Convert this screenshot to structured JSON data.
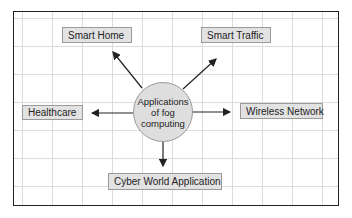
{
  "diagram": {
    "center": {
      "label_lines": [
        "Applications",
        "of fog",
        "computing"
      ]
    },
    "nodes": {
      "smart_home": "Smart Home",
      "smart_traffic": "Smart Traffic",
      "healthcare": "Healthcare",
      "wireless_network": "Wireless Network",
      "cyber_world": "Cyber World Application"
    },
    "edges": [
      {
        "from": "Applications of fog computing",
        "to": "Smart Home"
      },
      {
        "from": "Applications of fog computing",
        "to": "Smart Traffic"
      },
      {
        "from": "Applications of fog computing",
        "to": "Healthcare"
      },
      {
        "from": "Applications of fog computing",
        "to": "Wireless Network"
      },
      {
        "from": "Applications of fog computing",
        "to": "Cyber World Application"
      }
    ],
    "colors": {
      "node_fill": "#e2e2e2",
      "node_border": "#9a9a9a",
      "frame_border": "#222222",
      "grid": "#dcdcdc",
      "arrow": "#222222"
    }
  }
}
